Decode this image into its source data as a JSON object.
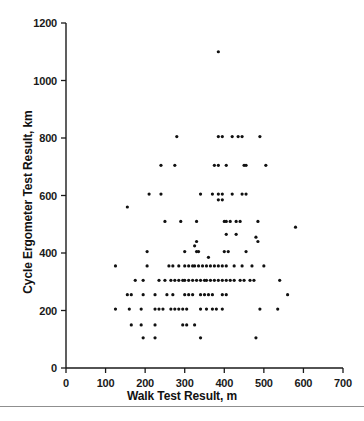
{
  "chart_data": {
    "type": "scatter",
    "title": "",
    "xlabel": "Walk Test Result, m",
    "ylabel": "Cycle Ergometer Test Result, km",
    "xlim": [
      0,
      700
    ],
    "ylim": [
      0,
      1200
    ],
    "xticks": [
      0,
      100,
      200,
      300,
      400,
      500,
      600,
      700
    ],
    "yticks": [
      0,
      200,
      400,
      600,
      800,
      1000,
      1200
    ],
    "xtick_labels": [
      "0",
      "100",
      "200",
      "300",
      "400",
      "500",
      "600",
      "700"
    ],
    "ytick_labels": [
      "0",
      "200",
      "400",
      "600",
      "800",
      "1000",
      "1200"
    ],
    "grid": false,
    "legend": null,
    "marker": {
      "shape": "circle",
      "color": "#111111",
      "size_px": 3.2
    },
    "axis_color": "#1a1a1a",
    "background": "#ffffff",
    "n_points": 192,
    "points": [
      [
        385,
        1100
      ],
      [
        280,
        805
      ],
      [
        385,
        805
      ],
      [
        395,
        805
      ],
      [
        420,
        805
      ],
      [
        435,
        805
      ],
      [
        445,
        805
      ],
      [
        490,
        805
      ],
      [
        240,
        705
      ],
      [
        275,
        705
      ],
      [
        375,
        705
      ],
      [
        385,
        705
      ],
      [
        405,
        705
      ],
      [
        450,
        705
      ],
      [
        455,
        705
      ],
      [
        505,
        705
      ],
      [
        210,
        605
      ],
      [
        240,
        605
      ],
      [
        340,
        605
      ],
      [
        370,
        605
      ],
      [
        385,
        605
      ],
      [
        395,
        605
      ],
      [
        420,
        605
      ],
      [
        445,
        605
      ],
      [
        455,
        605
      ],
      [
        385,
        585
      ],
      [
        395,
        585
      ],
      [
        155,
        560
      ],
      [
        250,
        510
      ],
      [
        290,
        510
      ],
      [
        330,
        510
      ],
      [
        400,
        510
      ],
      [
        405,
        510
      ],
      [
        415,
        510
      ],
      [
        430,
        510
      ],
      [
        440,
        510
      ],
      [
        485,
        510
      ],
      [
        580,
        490
      ],
      [
        405,
        465
      ],
      [
        430,
        465
      ],
      [
        480,
        455
      ],
      [
        330,
        440
      ],
      [
        485,
        440
      ],
      [
        325,
        425
      ],
      [
        205,
        405
      ],
      [
        300,
        405
      ],
      [
        330,
        405
      ],
      [
        335,
        405
      ],
      [
        400,
        405
      ],
      [
        410,
        405
      ],
      [
        455,
        405
      ],
      [
        360,
        385
      ],
      [
        125,
        355
      ],
      [
        205,
        355
      ],
      [
        260,
        355
      ],
      [
        270,
        355
      ],
      [
        285,
        355
      ],
      [
        300,
        355
      ],
      [
        310,
        355
      ],
      [
        320,
        355
      ],
      [
        325,
        355
      ],
      [
        335,
        355
      ],
      [
        345,
        355
      ],
      [
        355,
        355
      ],
      [
        365,
        355
      ],
      [
        375,
        355
      ],
      [
        385,
        355
      ],
      [
        395,
        355
      ],
      [
        405,
        355
      ],
      [
        425,
        355
      ],
      [
        445,
        355
      ],
      [
        470,
        355
      ],
      [
        500,
        355
      ],
      [
        175,
        305
      ],
      [
        195,
        305
      ],
      [
        235,
        305
      ],
      [
        250,
        305
      ],
      [
        265,
        305
      ],
      [
        275,
        305
      ],
      [
        285,
        305
      ],
      [
        295,
        305
      ],
      [
        300,
        305
      ],
      [
        310,
        305
      ],
      [
        320,
        305
      ],
      [
        330,
        305
      ],
      [
        340,
        305
      ],
      [
        350,
        305
      ],
      [
        355,
        305
      ],
      [
        365,
        305
      ],
      [
        375,
        305
      ],
      [
        385,
        305
      ],
      [
        395,
        305
      ],
      [
        405,
        305
      ],
      [
        415,
        305
      ],
      [
        425,
        305
      ],
      [
        440,
        305
      ],
      [
        450,
        305
      ],
      [
        465,
        305
      ],
      [
        475,
        305
      ],
      [
        540,
        305
      ],
      [
        155,
        255
      ],
      [
        165,
        255
      ],
      [
        195,
        255
      ],
      [
        225,
        255
      ],
      [
        255,
        255
      ],
      [
        270,
        255
      ],
      [
        300,
        255
      ],
      [
        310,
        255
      ],
      [
        320,
        255
      ],
      [
        340,
        255
      ],
      [
        350,
        255
      ],
      [
        360,
        255
      ],
      [
        370,
        255
      ],
      [
        395,
        255
      ],
      [
        405,
        255
      ],
      [
        560,
        255
      ],
      [
        125,
        205
      ],
      [
        160,
        205
      ],
      [
        190,
        205
      ],
      [
        225,
        205
      ],
      [
        235,
        205
      ],
      [
        245,
        205
      ],
      [
        265,
        205
      ],
      [
        275,
        205
      ],
      [
        285,
        205
      ],
      [
        295,
        205
      ],
      [
        305,
        205
      ],
      [
        340,
        205
      ],
      [
        355,
        205
      ],
      [
        370,
        205
      ],
      [
        380,
        205
      ],
      [
        395,
        205
      ],
      [
        490,
        205
      ],
      [
        535,
        205
      ],
      [
        165,
        150
      ],
      [
        190,
        150
      ],
      [
        225,
        150
      ],
      [
        295,
        150
      ],
      [
        305,
        150
      ],
      [
        325,
        150
      ],
      [
        195,
        105
      ],
      [
        225,
        105
      ],
      [
        340,
        105
      ],
      [
        480,
        105
      ]
    ]
  },
  "axes": {
    "y_title": "Cycle Ergometer Test Result, km",
    "x_title": "Walk Test Result, m"
  }
}
